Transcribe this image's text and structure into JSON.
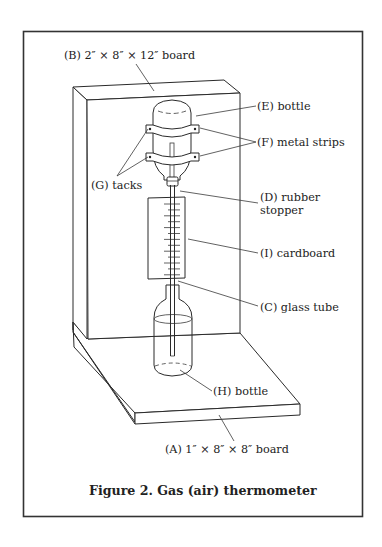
{
  "figure": {
    "caption": "Figure 2.  Gas (air) thermometer",
    "labels": {
      "B": "(B)  2″ × 8″ × 12″ board",
      "E": "(E)  bottle",
      "F": "(F)  metal strips",
      "G": "(G)  tacks",
      "D_line1": "(D)  rubber",
      "D_line2": "stopper",
      "I": "(I)  cardboard",
      "C": "(C)  glass tube",
      "H": "(H)  bottle",
      "A": "(A)  1″ × 8″ × 8″ board"
    },
    "components": [
      {
        "id": "A",
        "name": "base board",
        "dimensions": "1″ × 8″ × 8″"
      },
      {
        "id": "B",
        "name": "upright board",
        "dimensions": "2″ × 8″ × 12″"
      },
      {
        "id": "C",
        "name": "glass tube"
      },
      {
        "id": "D",
        "name": "rubber stopper"
      },
      {
        "id": "E",
        "name": "upper inverted bottle"
      },
      {
        "id": "F",
        "name": "metal strips"
      },
      {
        "id": "G",
        "name": "tacks"
      },
      {
        "id": "H",
        "name": "lower bottle with liquid"
      },
      {
        "id": "I",
        "name": "cardboard scale"
      }
    ],
    "scale_ticks": 13
  }
}
